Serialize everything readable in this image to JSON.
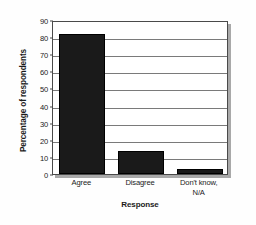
{
  "chart_data": {
    "type": "bar",
    "title": "",
    "subtitle": "",
    "categories": [
      "Agree",
      "Disagree",
      "Don't know,\nN/A"
    ],
    "category_lines": [
      [
        "Agree"
      ],
      [
        "Disagree"
      ],
      [
        "Don't know,",
        "N/A"
      ]
    ],
    "values": [
      82,
      13.5,
      3
    ],
    "xlabel": "Response",
    "ylabel": "Percentage of respondents",
    "ylim": [
      0,
      90
    ],
    "xlim_categories": 3,
    "yticks": [
      0,
      10,
      20,
      30,
      40,
      50,
      60,
      70,
      80,
      90
    ],
    "ytick_labels": [
      "0",
      "10",
      "20",
      "30",
      "40",
      "50",
      "60",
      "70",
      "80",
      "90"
    ],
    "grid": "horizontal",
    "legend": "none",
    "bar_color": "#1a1a1a",
    "plot_background": "#ffffff",
    "axis_color": "#4a4a4a",
    "gridline_color": "#7a7a7a",
    "shadow_color": "#a9a9a9",
    "figure_background": "#fefefe",
    "annotations": []
  }
}
